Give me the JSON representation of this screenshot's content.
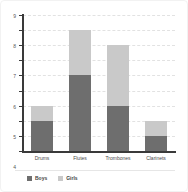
{
  "chart_data": {
    "type": "bar",
    "stacked": true,
    "title": "",
    "subtitle": "",
    "xlabel": "",
    "ylabel": "",
    "categories": [
      "Drums",
      "Flutes",
      "Trombones",
      "Clarinets"
    ],
    "series": [
      {
        "name": "Boys",
        "values": [
          2,
          5,
          3,
          1
        ],
        "color": "#6e6e6e"
      },
      {
        "name": "Girls",
        "values": [
          1,
          3,
          4,
          1
        ],
        "color": "#c9c9c9"
      }
    ],
    "totals": [
      3,
      8,
      7,
      2
    ],
    "ylim": [
      0,
      9
    ],
    "ytick_step": 1,
    "yticks": [
      0,
      1,
      2,
      3,
      4,
      5,
      6,
      7,
      8,
      9
    ],
    "ytick_labels": [
      "0",
      "1",
      "2",
      "3",
      "4",
      "5",
      "6",
      "7",
      "8",
      "9"
    ],
    "grid": true,
    "grid_style": "dashed",
    "grid_color": "#e2e2e2",
    "legend_position": "bottom",
    "legend_entries": [
      "Boys",
      "Girls"
    ],
    "background_color": "#ffffff",
    "axis_color": "#3a3a3a"
  }
}
